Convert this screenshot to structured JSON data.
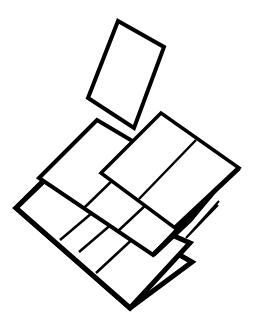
{
  "illustration": {
    "description": "Line-art icon of stacked tilted tile grids with a single card floating above",
    "background": "#ffffff",
    "stroke_color": "#000000"
  }
}
